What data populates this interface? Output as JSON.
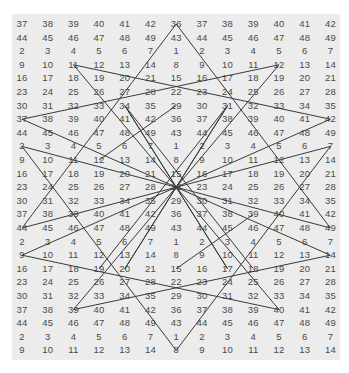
{
  "grid": {
    "columns": 13,
    "rows": 25,
    "origin_x": 22,
    "origin_y": 24,
    "col_spacing": 25.7,
    "row_spacing": 13.6,
    "values": [
      [
        37,
        38,
        39,
        40,
        41,
        42,
        36,
        37,
        38,
        39,
        40,
        41,
        42
      ],
      [
        44,
        45,
        46,
        47,
        48,
        49,
        43,
        44,
        45,
        46,
        47,
        48,
        49
      ],
      [
        2,
        3,
        4,
        5,
        6,
        7,
        1,
        2,
        3,
        4,
        5,
        6,
        7
      ],
      [
        9,
        10,
        11,
        12,
        13,
        14,
        8,
        9,
        10,
        11,
        12,
        13,
        14
      ],
      [
        16,
        17,
        18,
        19,
        20,
        21,
        15,
        16,
        17,
        18,
        19,
        20,
        21
      ],
      [
        23,
        24,
        25,
        26,
        27,
        28,
        22,
        23,
        24,
        25,
        26,
        27,
        28
      ],
      [
        30,
        31,
        32,
        33,
        34,
        35,
        29,
        30,
        31,
        32,
        33,
        34,
        35
      ],
      [
        37,
        38,
        39,
        40,
        41,
        42,
        36,
        37,
        38,
        39,
        40,
        41,
        42
      ],
      [
        44,
        45,
        46,
        47,
        48,
        49,
        43,
        44,
        45,
        46,
        47,
        48,
        49
      ],
      [
        2,
        3,
        4,
        5,
        6,
        7,
        1,
        2,
        3,
        4,
        5,
        6,
        7
      ],
      [
        9,
        10,
        11,
        12,
        13,
        14,
        8,
        9,
        10,
        11,
        12,
        13,
        14
      ],
      [
        16,
        17,
        18,
        19,
        20,
        21,
        15,
        16,
        17,
        18,
        19,
        20,
        21
      ],
      [
        23,
        24,
        25,
        26,
        27,
        28,
        22,
        23,
        24,
        25,
        26,
        27,
        28
      ],
      [
        30,
        31,
        32,
        33,
        34,
        35,
        29,
        30,
        31,
        32,
        33,
        34,
        35
      ],
      [
        37,
        38,
        39,
        40,
        41,
        42,
        36,
        37,
        38,
        39,
        40,
        41,
        42
      ],
      [
        44,
        45,
        46,
        47,
        48,
        49,
        43,
        44,
        45,
        46,
        47,
        48,
        49
      ],
      [
        2,
        3,
        4,
        5,
        6,
        7,
        1,
        2,
        3,
        4,
        5,
        6,
        7
      ],
      [
        9,
        10,
        11,
        12,
        13,
        14,
        8,
        9,
        10,
        11,
        12,
        13,
        14
      ],
      [
        16,
        17,
        18,
        19,
        20,
        21,
        15,
        16,
        17,
        18,
        19,
        20,
        21
      ],
      [
        23,
        24,
        25,
        26,
        27,
        28,
        22,
        23,
        24,
        25,
        26,
        27,
        28
      ],
      [
        30,
        31,
        32,
        33,
        34,
        35,
        29,
        30,
        31,
        32,
        33,
        34,
        35
      ],
      [
        37,
        38,
        39,
        40,
        41,
        42,
        36,
        37,
        38,
        39,
        40,
        41,
        42
      ],
      [
        44,
        45,
        46,
        47,
        48,
        49,
        43,
        44,
        45,
        46,
        47,
        48,
        49
      ],
      [
        2,
        3,
        4,
        5,
        6,
        7,
        1,
        2,
        3,
        4,
        5,
        6,
        7
      ],
      [
        9,
        10,
        11,
        12,
        13,
        14,
        8,
        9,
        10,
        11,
        12,
        13,
        14
      ]
    ]
  },
  "overlay": {
    "stroke_color": "#3a3a3a",
    "center": [
      6,
      12
    ],
    "segments": [
      [
        [
          6,
          0
        ],
        [
          0,
          15
        ]
      ],
      [
        [
          6,
          0
        ],
        [
          12,
          15
        ]
      ],
      [
        [
          6,
          24
        ],
        [
          0,
          9
        ]
      ],
      [
        [
          6,
          24
        ],
        [
          12,
          9
        ]
      ],
      [
        [
          0,
          9
        ],
        [
          12,
          15
        ]
      ],
      [
        [
          12,
          9
        ],
        [
          0,
          15
        ]
      ],
      [
        [
          2,
          3
        ],
        [
          6,
          12
        ]
      ],
      [
        [
          2,
          3
        ],
        [
          12,
          7
        ]
      ],
      [
        [
          10,
          3
        ],
        [
          6,
          12
        ]
      ],
      [
        [
          10,
          3
        ],
        [
          0,
          7
        ]
      ],
      [
        [
          2,
          21
        ],
        [
          6,
          12
        ]
      ],
      [
        [
          2,
          21
        ],
        [
          12,
          17
        ]
      ],
      [
        [
          10,
          21
        ],
        [
          6,
          12
        ]
      ],
      [
        [
          10,
          21
        ],
        [
          0,
          17
        ]
      ],
      [
        [
          0,
          7
        ],
        [
          6,
          12
        ]
      ],
      [
        [
          12,
          7
        ],
        [
          6,
          12
        ]
      ],
      [
        [
          0,
          17
        ],
        [
          6,
          12
        ]
      ],
      [
        [
          12,
          17
        ],
        [
          6,
          12
        ]
      ],
      [
        [
          4,
          6
        ],
        [
          6,
          12
        ]
      ],
      [
        [
          8,
          6
        ],
        [
          6,
          12
        ]
      ],
      [
        [
          4,
          18
        ],
        [
          6,
          12
        ]
      ],
      [
        [
          8,
          18
        ],
        [
          6,
          12
        ]
      ],
      [
        [
          4,
          6
        ],
        [
          8,
          18
        ]
      ],
      [
        [
          8,
          6
        ],
        [
          4,
          18
        ]
      ],
      [
        [
          3,
          18
        ],
        [
          8,
          6
        ]
      ],
      [
        [
          9,
          18
        ],
        [
          4,
          6
        ]
      ],
      [
        [
          6,
          6
        ],
        [
          3,
          10
        ]
      ],
      [
        [
          6,
          18
        ],
        [
          9,
          14
        ]
      ]
    ]
  }
}
